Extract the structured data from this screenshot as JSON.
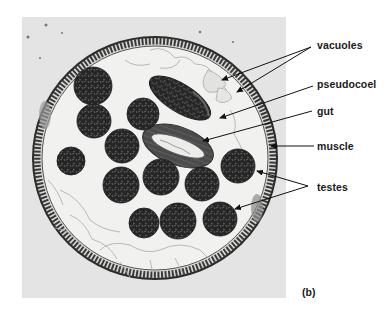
{
  "figure": {
    "panel_label": "(b)",
    "labels": [
      {
        "id": "vacuoles",
        "text": "vacuoles",
        "x": 317,
        "y": 39
      },
      {
        "id": "pseudocoel",
        "text": "pseudocoel",
        "x": 317,
        "y": 78
      },
      {
        "id": "gut",
        "text": "gut",
        "x": 317,
        "y": 105
      },
      {
        "id": "muscle",
        "text": "muscle",
        "x": 317,
        "y": 140
      },
      {
        "id": "testes",
        "text": "testes",
        "x": 317,
        "y": 181
      }
    ],
    "arrows": [
      {
        "label": "vacuoles",
        "from": [
          311,
          47
        ],
        "to": [
          222,
          80
        ]
      },
      {
        "label": "vacuoles",
        "from": [
          311,
          47
        ],
        "to": [
          237,
          92
        ]
      },
      {
        "label": "pseudocoel",
        "from": [
          313,
          86
        ],
        "to": [
          220,
          118
        ]
      },
      {
        "label": "gut",
        "from": [
          312,
          111
        ],
        "to": [
          203,
          141
        ]
      },
      {
        "label": "muscle",
        "from": [
          314,
          146
        ],
        "to": [
          271,
          146
        ]
      },
      {
        "label": "testes",
        "from": [
          308,
          186
        ],
        "to": [
          257,
          171
        ]
      },
      {
        "label": "testes",
        "from": [
          308,
          186
        ],
        "to": [
          235,
          209
        ]
      }
    ],
    "colors": {
      "photo_bg": "#e4e4e4",
      "cavity": "#f1f1ef",
      "muscle": "#3a3a3a",
      "testis": "#262626",
      "label_text": "#1a1a1a"
    }
  }
}
